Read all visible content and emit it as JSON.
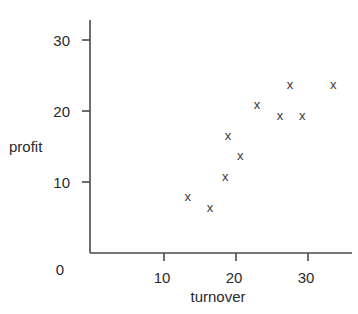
{
  "chart_data": {
    "type": "scatter",
    "title": "",
    "xlabel": "turnover",
    "ylabel": "profit",
    "xlim": [
      0,
      36
    ],
    "ylim": [
      0,
      34
    ],
    "x_ticks": [
      10,
      20,
      30
    ],
    "y_ticks": [
      10,
      20,
      30
    ],
    "origin_label": "0",
    "grid": false,
    "legend": null,
    "marker": "x",
    "marker_color": "#3a3a3a",
    "axis_color": "#4a4a4a",
    "points": [
      {
        "x": 13.3,
        "y": 7.9
      },
      {
        "x": 16.4,
        "y": 6.3
      },
      {
        "x": 18.5,
        "y": 10.7
      },
      {
        "x": 18.9,
        "y": 16.5
      },
      {
        "x": 20.6,
        "y": 13.7
      },
      {
        "x": 22.9,
        "y": 20.8
      },
      {
        "x": 26.1,
        "y": 19.3
      },
      {
        "x": 27.5,
        "y": 23.7
      },
      {
        "x": 29.2,
        "y": 19.3
      },
      {
        "x": 33.5,
        "y": 23.7
      }
    ]
  }
}
